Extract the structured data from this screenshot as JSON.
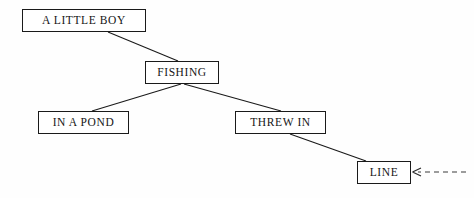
{
  "diagram": {
    "type": "tree-diagram",
    "title": "",
    "background_color": "#fefefe",
    "line_color": "#1a1a1a",
    "text_color": "#151515",
    "nodes": [
      {
        "id": "a-little-boy",
        "label": "A LITTLE BOY",
        "x": 22,
        "y": 9,
        "width": 124,
        "height": 23
      },
      {
        "id": "fishing",
        "label": "FISHING",
        "x": 145,
        "y": 61,
        "width": 74,
        "height": 23
      },
      {
        "id": "in-a-pond",
        "label": "IN A POND",
        "x": 38,
        "y": 111,
        "width": 91,
        "height": 23
      },
      {
        "id": "threw-in",
        "label": "THREW IN",
        "x": 235,
        "y": 111,
        "width": 91,
        "height": 23
      },
      {
        "id": "line",
        "label": "LINE",
        "x": 357,
        "y": 161,
        "width": 54,
        "height": 23
      }
    ],
    "edges": [
      {
        "id": "edge-boy-fishing",
        "from": "a-little-boy",
        "to": "fishing",
        "style": "solid",
        "x1": 108,
        "y1": 32,
        "x2": 178,
        "y2": 61
      },
      {
        "id": "edge-fishing-pond",
        "from": "fishing",
        "to": "in-a-pond",
        "style": "solid",
        "x1": 181,
        "y1": 84,
        "x2": 92,
        "y2": 111
      },
      {
        "id": "edge-fishing-threw",
        "from": "fishing",
        "to": "threw-in",
        "style": "solid",
        "x1": 184,
        "y1": 84,
        "x2": 281,
        "y2": 111
      },
      {
        "id": "edge-threw-line",
        "from": "threw-in",
        "to": "line",
        "style": "solid",
        "x1": 290,
        "y1": 134,
        "x2": 366,
        "y2": 161
      }
    ],
    "annotations": [
      {
        "id": "incoming-dashed-arrow",
        "style": "dashed",
        "arrowhead": "left",
        "target": "line",
        "x1": 466,
        "y1": 172,
        "x2": 413,
        "y2": 172,
        "dash_pattern": "5 4"
      }
    ]
  }
}
